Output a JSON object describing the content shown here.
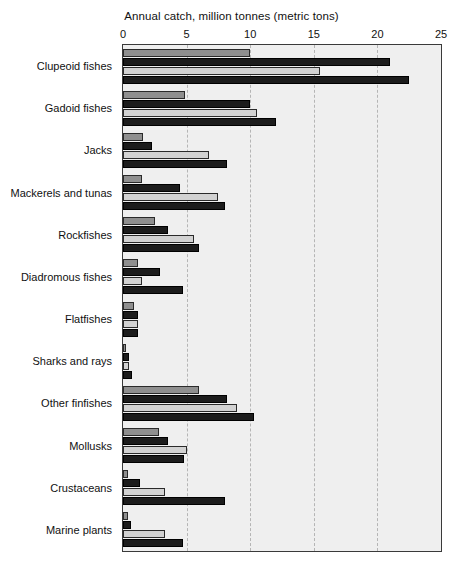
{
  "chart_data": {
    "type": "bar",
    "orientation": "horizontal",
    "title": "Annual catch, million tonnes (metric tons)",
    "xlabel": "Annual catch, million tonnes (metric tons)",
    "ylabel": "",
    "xlim": [
      0,
      25
    ],
    "xticks": [
      0,
      5,
      10,
      15,
      20,
      25
    ],
    "xtick_labels": [
      "0",
      "5",
      "10",
      "15",
      "20",
      "25"
    ],
    "grid": true,
    "grid_axis": "x",
    "grid_style": "dashed",
    "legend": false,
    "legend_position": "none",
    "plot_background": "#efefef",
    "categories": [
      "Clupeoid fishes",
      "Gadoid fishes",
      "Jacks",
      "Mackerels and tunas",
      "Rockfishes",
      "Diadromous fishes",
      "Flatfishes",
      "Sharks and rays",
      "Other finfishes",
      "Mollusks",
      "Crustaceans",
      "Marine plants"
    ],
    "series": [
      {
        "name": "series-1",
        "color": "#8f8f8f",
        "values": [
          10.0,
          4.9,
          1.6,
          1.5,
          2.5,
          1.2,
          0.9,
          0.25,
          6.0,
          2.8,
          0.4,
          0.4
        ]
      },
      {
        "name": "series-2",
        "color": "#1c1c1c",
        "values": [
          21.0,
          10.0,
          2.3,
          4.5,
          3.5,
          2.9,
          1.2,
          0.5,
          8.2,
          3.5,
          1.3,
          0.6
        ]
      },
      {
        "name": "series-3",
        "color": "#d2d2d2",
        "values": [
          15.5,
          10.5,
          6.8,
          7.5,
          5.6,
          1.5,
          1.2,
          0.5,
          9.0,
          5.0,
          3.3,
          3.3
        ]
      },
      {
        "name": "series-4",
        "color": "#1c1c1c",
        "values": [
          22.5,
          12.0,
          8.2,
          8.0,
          6.0,
          4.7,
          1.2,
          0.7,
          10.3,
          4.8,
          8.0,
          4.7
        ]
      }
    ]
  }
}
